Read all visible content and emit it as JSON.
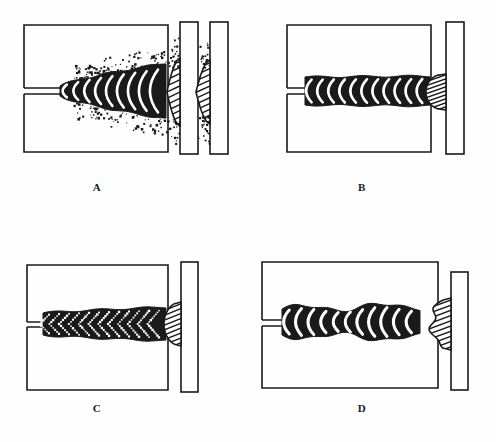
{
  "figure": {
    "background_color": "#fefefe",
    "ink_color": "#1a1a1a",
    "panel_count": 4
  },
  "panels": [
    {
      "id": "A",
      "label": "A",
      "label_x": 97,
      "label_y": 187,
      "plate": {
        "x": 24,
        "y": 25,
        "w": 144,
        "h": 127
      },
      "groove": {
        "x": 24,
        "y": 88,
        "w": 40,
        "h": 6
      },
      "bead": {
        "name": "wide-spattered-bead",
        "description": "wide flat bead with heavy spatter",
        "start_x": 60,
        "end_x": 166,
        "center_y": 91,
        "half_height_start": 5,
        "half_height_end": 28,
        "ripple_count": 9,
        "spatter": true,
        "spatter_density": 170
      },
      "sections": [
        {
          "name": "section-plate-left",
          "x": 180,
          "y": 22,
          "w": 18,
          "h": 132,
          "bulge_center_y": 92,
          "bulge_half_h": 34,
          "bulge_w": 13,
          "shape": "flat-wide",
          "hatch_count": 11,
          "spatter": true
        },
        {
          "name": "section-plate-right",
          "x": 210,
          "y": 22,
          "w": 18,
          "h": 132,
          "bulge_center_y": 92,
          "bulge_half_h": 32,
          "bulge_w": 14,
          "shape": "flat-wide",
          "hatch_count": 11,
          "spatter": true
        }
      ]
    },
    {
      "id": "B",
      "label": "B",
      "label_x": 362,
      "label_y": 187,
      "plate": {
        "x": 287,
        "y": 25,
        "w": 144,
        "h": 127
      },
      "groove": {
        "x": 287,
        "y": 88,
        "w": 20,
        "h": 6
      },
      "bead": {
        "name": "narrow-high-bead",
        "description": "narrow uniform high crown bead",
        "start_x": 305,
        "end_x": 430,
        "center_y": 91,
        "half_height_start": 14,
        "half_height_end": 15,
        "ripple_count": 11,
        "spatter": false,
        "spatter_density": 0
      },
      "sections": [
        {
          "name": "section-plate",
          "x": 446,
          "y": 22,
          "w": 18,
          "h": 132,
          "bulge_center_y": 92,
          "bulge_half_h": 18,
          "bulge_w": 20,
          "shape": "narrow-tall",
          "hatch_count": 9,
          "spatter": false
        }
      ]
    },
    {
      "id": "C",
      "label": "C",
      "label_x": 97,
      "label_y": 408,
      "plate": {
        "x": 27,
        "y": 265,
        "w": 141,
        "h": 125
      },
      "groove": {
        "x": 27,
        "y": 322,
        "w": 18,
        "h": 5
      },
      "bead": {
        "name": "stippled-medium-bead",
        "description": "medium bead with dotted stippled ripples",
        "start_x": 43,
        "end_x": 166,
        "center_y": 324,
        "half_height_start": 11,
        "half_height_end": 17,
        "ripple_count": 12,
        "spatter": false,
        "spatter_density": 0,
        "stippled": true
      },
      "sections": [
        {
          "name": "section-plate",
          "x": 181,
          "y": 262,
          "w": 17,
          "h": 130,
          "bulge_center_y": 324,
          "bulge_half_h": 22,
          "bulge_w": 17,
          "shape": "rounded-compact",
          "hatch_count": 9,
          "spatter": false
        }
      ]
    },
    {
      "id": "D",
      "label": "D",
      "label_x": 362,
      "label_y": 408,
      "plate": {
        "x": 262,
        "y": 262,
        "w": 176,
        "h": 126
      },
      "groove": {
        "x": 262,
        "y": 320,
        "w": 22,
        "h": 6
      },
      "bead": {
        "name": "irregular-lumpy-bead",
        "description": "irregular lumpy bead with uneven width",
        "start_x": 282,
        "end_x": 420,
        "center_y": 322,
        "half_height_start": 13,
        "half_height_end": 16,
        "ripple_count": 11,
        "spatter": false,
        "spatter_density": 0,
        "irregular": true
      },
      "sections": [
        {
          "name": "section-plate",
          "x": 451,
          "y": 272,
          "w": 17,
          "h": 118,
          "bulge_center_y": 324,
          "bulge_half_h": 26,
          "bulge_w": 19,
          "shape": "irregular-tall",
          "hatch_count": 10,
          "spatter": false
        }
      ]
    }
  ]
}
